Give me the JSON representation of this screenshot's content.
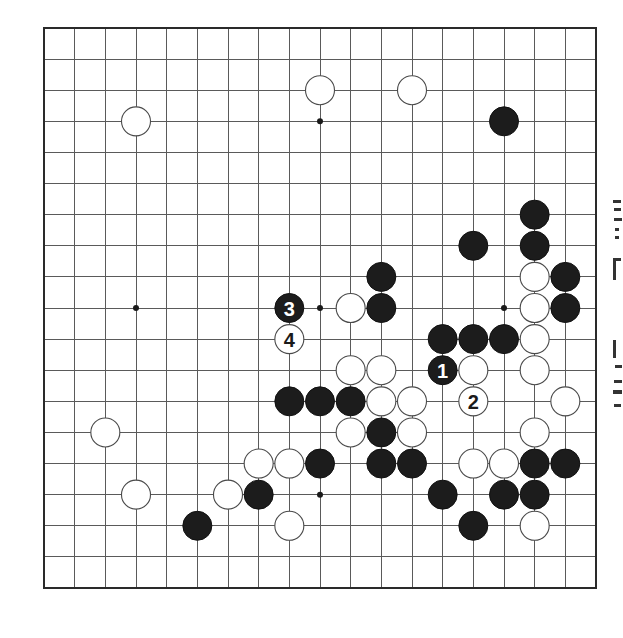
{
  "diagram": {
    "type": "go-board",
    "board_size": 19,
    "geometry": {
      "left": 44,
      "top": 28,
      "right": 596,
      "bottom": 588,
      "stone_radius": 14.5
    },
    "colors": {
      "background": "#ffffff",
      "grid": "#5a5a5a",
      "border": "#2a2a2a",
      "black_stone": "#1c1c1c",
      "white_stone": "#ffffff",
      "white_outline": "#4a4a4a"
    },
    "star_points": [
      {
        "col": 9,
        "row": 3
      },
      {
        "col": 3,
        "row": 9
      },
      {
        "col": 9,
        "row": 9
      },
      {
        "col": 15,
        "row": 9
      },
      {
        "col": 9,
        "row": 15
      }
    ],
    "stones": {
      "white": [
        {
          "col": 3,
          "row": 3
        },
        {
          "col": 9,
          "row": 2
        },
        {
          "col": 12,
          "row": 2
        },
        {
          "col": 16,
          "row": 8
        },
        {
          "col": 10,
          "row": 9
        },
        {
          "col": 16,
          "row": 9
        },
        {
          "col": 8,
          "row": 10,
          "label": "4"
        },
        {
          "col": 16,
          "row": 10
        },
        {
          "col": 10,
          "row": 11
        },
        {
          "col": 11,
          "row": 11
        },
        {
          "col": 14,
          "row": 11
        },
        {
          "col": 16,
          "row": 11
        },
        {
          "col": 11,
          "row": 12
        },
        {
          "col": 12,
          "row": 12
        },
        {
          "col": 14,
          "row": 12,
          "label": "2"
        },
        {
          "col": 17,
          "row": 12
        },
        {
          "col": 2,
          "row": 13
        },
        {
          "col": 10,
          "row": 13
        },
        {
          "col": 12,
          "row": 13
        },
        {
          "col": 16,
          "row": 13
        },
        {
          "col": 7,
          "row": 14
        },
        {
          "col": 8,
          "row": 14
        },
        {
          "col": 14,
          "row": 14
        },
        {
          "col": 15,
          "row": 14
        },
        {
          "col": 3,
          "row": 15
        },
        {
          "col": 6,
          "row": 15
        },
        {
          "col": 8,
          "row": 16
        },
        {
          "col": 16,
          "row": 16
        }
      ],
      "black": [
        {
          "col": 15,
          "row": 3
        },
        {
          "col": 16,
          "row": 6
        },
        {
          "col": 14,
          "row": 7
        },
        {
          "col": 16,
          "row": 7
        },
        {
          "col": 11,
          "row": 8
        },
        {
          "col": 17,
          "row": 8
        },
        {
          "col": 8,
          "row": 9,
          "label": "3"
        },
        {
          "col": 11,
          "row": 9
        },
        {
          "col": 17,
          "row": 9
        },
        {
          "col": 13,
          "row": 10
        },
        {
          "col": 14,
          "row": 10
        },
        {
          "col": 15,
          "row": 10
        },
        {
          "col": 13,
          "row": 11,
          "label": "1"
        },
        {
          "col": 8,
          "row": 12
        },
        {
          "col": 9,
          "row": 12
        },
        {
          "col": 10,
          "row": 12
        },
        {
          "col": 11,
          "row": 13
        },
        {
          "col": 9,
          "row": 14
        },
        {
          "col": 11,
          "row": 14
        },
        {
          "col": 12,
          "row": 14
        },
        {
          "col": 16,
          "row": 14
        },
        {
          "col": 17,
          "row": 14
        },
        {
          "col": 7,
          "row": 15
        },
        {
          "col": 13,
          "row": 15
        },
        {
          "col": 15,
          "row": 15
        },
        {
          "col": 16,
          "row": 15
        },
        {
          "col": 5,
          "row": 16
        },
        {
          "col": 14,
          "row": 16
        }
      ]
    },
    "move_sequence": [
      {
        "move": "1",
        "color": "black",
        "col": 13,
        "row": 11
      },
      {
        "move": "2",
        "color": "white",
        "col": 14,
        "row": 12
      },
      {
        "move": "3",
        "color": "black",
        "col": 8,
        "row": 9
      },
      {
        "move": "4",
        "color": "white",
        "col": 8,
        "row": 10
      }
    ]
  },
  "side_text": {
    "description": "cropped vertical CJK characters at right edge (illegible)",
    "visible_fragments": 4
  }
}
